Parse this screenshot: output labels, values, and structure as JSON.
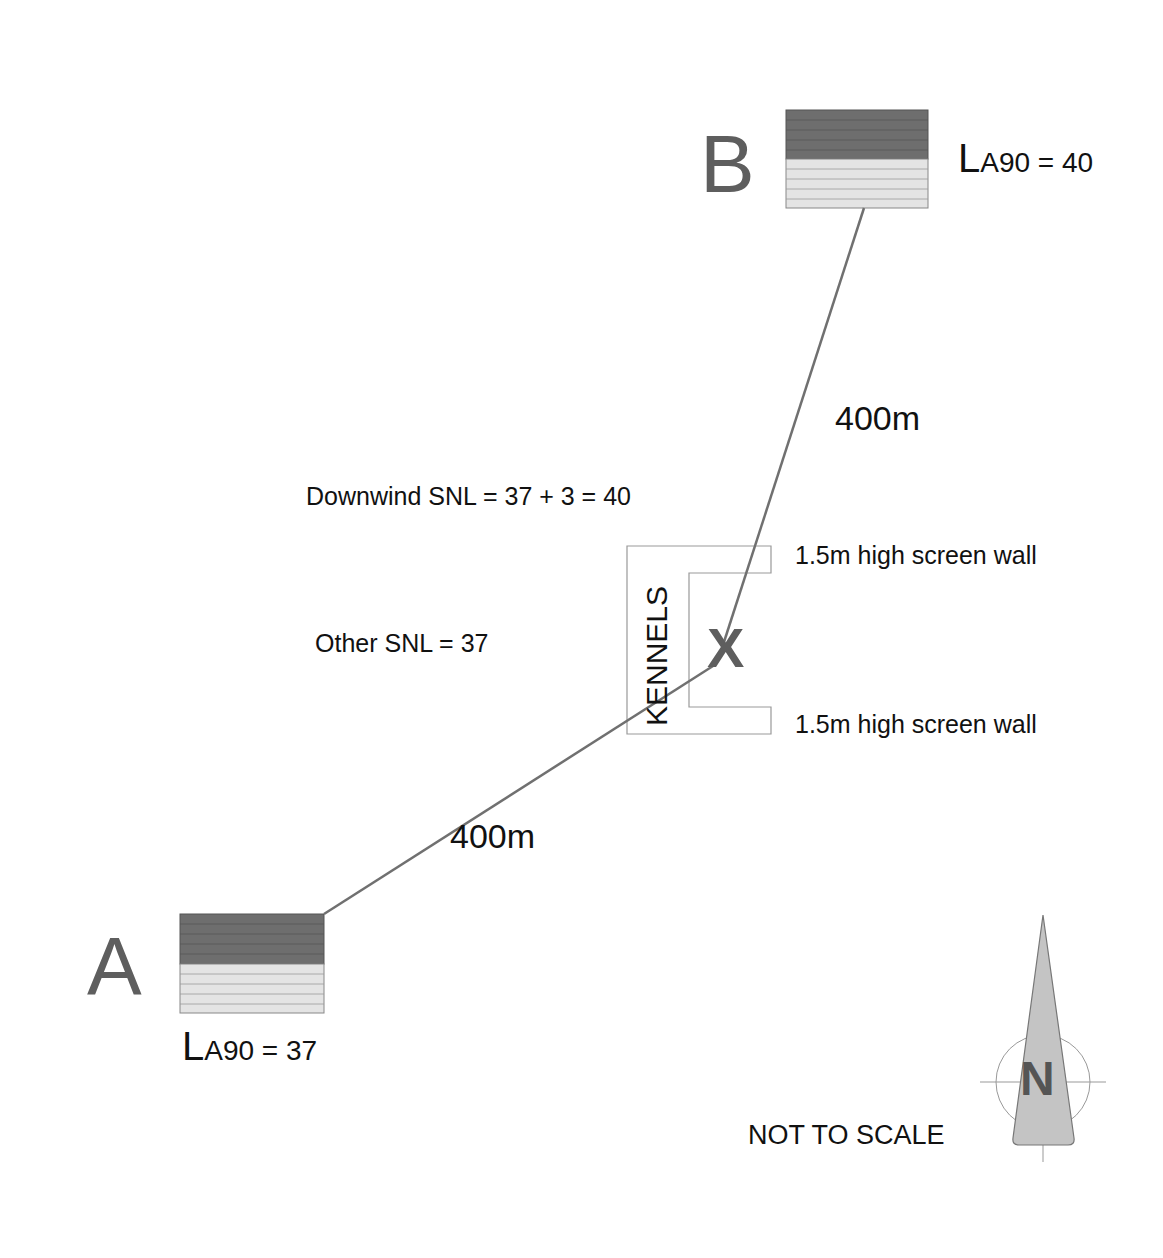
{
  "diagram": {
    "buildings": [
      {
        "id": "B",
        "letter": "B",
        "level_prefix": "L",
        "level_text": "A90 = 40"
      },
      {
        "id": "A",
        "letter": "A",
        "level_prefix": "L",
        "level_text": "A90 = 37"
      }
    ],
    "distances": [
      {
        "from": "B",
        "to": "X",
        "label": "400m"
      },
      {
        "from": "A",
        "to": "X",
        "label": "400m"
      }
    ],
    "receiver": {
      "label": "KENNELS",
      "marker": "X"
    },
    "annotations": {
      "downwind_snl": "Downwind SNL = 37 + 3 = 40",
      "other_snl": "Other SNL = 37",
      "wall_top": "1.5m high screen wall",
      "wall_bottom": "1.5m high screen wall",
      "not_to_scale": "NOT TO SCALE"
    },
    "north_arrow": {
      "label": "N"
    },
    "colors": {
      "building_dark": "#6e6e6e",
      "building_light": "#e4e4e4",
      "line": "#707070",
      "north_fill": "#c4c4c4",
      "letter_gray": "#5e5e5e"
    }
  }
}
